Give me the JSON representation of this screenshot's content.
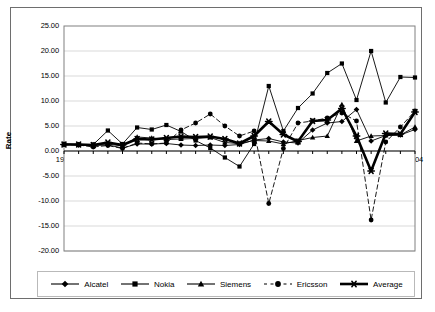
{
  "chart_data": {
    "type": "line",
    "title": "",
    "subtitle": "",
    "xlabel": "",
    "ylabel": "Rate",
    "xlim": [
      1980,
      2004
    ],
    "ylim": [
      -20,
      25
    ],
    "grid": true,
    "legend_position": "bottom",
    "x": [
      1980,
      1981,
      1982,
      1983,
      1984,
      1985,
      1986,
      1987,
      1988,
      1989,
      1990,
      1991,
      1992,
      1993,
      1994,
      1995,
      1996,
      1997,
      1998,
      1999,
      2000,
      2001,
      2002,
      2003,
      2004
    ],
    "ytick_labels": [
      "25.00",
      "20.00",
      "15.00",
      "10.00",
      "5.00",
      "0.00",
      "-5.00",
      "-10.00",
      "-15.00",
      "-20.00"
    ],
    "ytick_values": [
      25,
      20,
      15,
      10,
      5,
      0,
      -5,
      -10,
      -15,
      -20
    ],
    "xtick_labels": [
      "1980",
      "1982",
      "1984",
      "1986",
      "1988",
      "1990",
      "1992",
      "1994",
      "1996",
      "1998",
      "2000",
      "2002",
      "2004"
    ],
    "xtick_values": [
      1980,
      1982,
      1984,
      1986,
      1988,
      1990,
      1992,
      1994,
      1996,
      1998,
      2000,
      2002,
      2004
    ],
    "series": [
      {
        "name": "Alcatel",
        "marker": "diamond",
        "line": "solid",
        "width": "thin",
        "values": [
          1.3,
          1.2,
          1.1,
          1.2,
          0.6,
          1.4,
          1.4,
          1.5,
          1.2,
          1.1,
          1.2,
          1.1,
          1.3,
          2.2,
          2.5,
          1.8,
          1.6,
          4.2,
          5.6,
          5.9,
          8.3,
          2.0,
          3.1,
          3.2,
          4.3
        ]
      },
      {
        "name": "Nokia",
        "marker": "square",
        "line": "solid",
        "width": "thin",
        "values": [
          1.4,
          1.3,
          1.3,
          4.1,
          1.4,
          4.7,
          4.3,
          5.2,
          3.9,
          2.1,
          0.6,
          -1.3,
          -3.1,
          1.4,
          13.0,
          4.0,
          8.6,
          11.5,
          15.6,
          17.5,
          10.2,
          20.0,
          9.7,
          14.8,
          14.7
        ]
      },
      {
        "name": "Siemens",
        "marker": "triangle",
        "line": "solid",
        "width": "thin",
        "values": [
          1.4,
          1.3,
          1.3,
          1.4,
          1.0,
          2.8,
          2.6,
          2.3,
          2.4,
          2.5,
          2.7,
          1.7,
          1.5,
          2.1,
          2.0,
          1.4,
          2.1,
          2.7,
          3.0,
          9.3,
          2.0,
          3.0,
          3.1,
          3.2,
          4.8
        ]
      },
      {
        "name": "Ericsson",
        "marker": "circle",
        "line": "dashed",
        "width": "thin",
        "values": [
          1.3,
          1.2,
          0.8,
          1.1,
          0.5,
          1.6,
          1.4,
          1.6,
          4.2,
          5.6,
          7.4,
          5.0,
          3.0,
          4.0,
          -10.5,
          0.5,
          5.6,
          6.0,
          6.6,
          7.6,
          6.0,
          -13.8,
          1.8,
          4.8,
          8.0
        ]
      },
      {
        "name": "Average",
        "marker": "star",
        "line": "solid",
        "width": "thick",
        "values": [
          1.3,
          1.3,
          1.2,
          1.7,
          1.2,
          2.4,
          2.3,
          2.6,
          2.9,
          2.8,
          2.9,
          2.4,
          1.5,
          3.0,
          5.9,
          3.3,
          1.9,
          6.0,
          6.2,
          8.5,
          3.0,
          -4.0,
          3.5,
          3.4,
          7.8
        ]
      }
    ],
    "colors": {
      "series_line": "#000000",
      "grid": "#d9d9d9",
      "plot_border": "#808080",
      "frame_border": "#6e6e6e",
      "background": "#ffffff"
    }
  },
  "legend": {
    "items": [
      {
        "label": "Alcatel",
        "marker": "diamond",
        "line": "solid"
      },
      {
        "label": "Nokia",
        "marker": "square",
        "line": "solid"
      },
      {
        "label": "Siemens",
        "marker": "triangle",
        "line": "solid"
      },
      {
        "label": "Ericsson",
        "marker": "circle",
        "line": "dotted"
      },
      {
        "label": "Average",
        "marker": "star",
        "line": "solid-thick"
      }
    ]
  }
}
